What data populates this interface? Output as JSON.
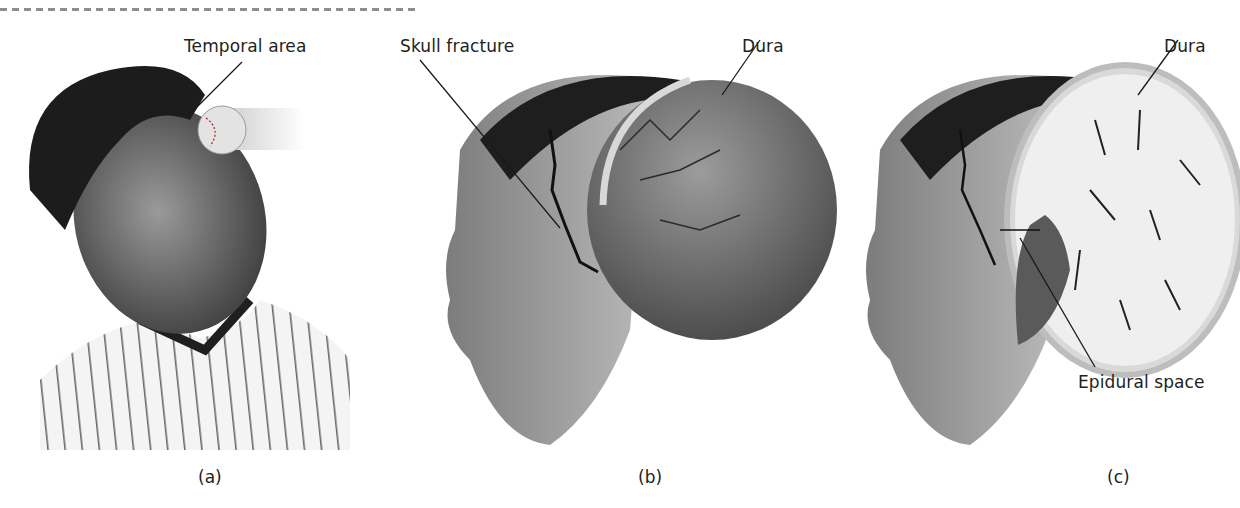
{
  "figure": {
    "panels": [
      {
        "id": "a",
        "caption": "(a)",
        "description": "Child in pinstripe jersey struck on the side of the head by a baseball",
        "labels": [
          {
            "text": "Temporal area"
          }
        ]
      },
      {
        "id": "b",
        "caption": "(b)",
        "description": "Side view of head with skull cut away showing skull fracture and dura with vessels",
        "labels": [
          {
            "text": "Skull fracture"
          },
          {
            "text": "Dura"
          }
        ]
      },
      {
        "id": "c",
        "caption": "(c)",
        "description": "Side view with cross-section of brain showing blood collected in the epidural space",
        "labels": [
          {
            "text": "Dura"
          },
          {
            "text": "Epidural space"
          }
        ]
      }
    ]
  },
  "colors": {
    "background": "#ffffff",
    "text": "#231f20",
    "leader_line": "#1a1a1a",
    "hair": "#1c1c1c",
    "skin": "#8a8a8a",
    "dura": "#6e6e6e",
    "brain_white": "#ececec",
    "hematoma": "#5a5a5a"
  }
}
